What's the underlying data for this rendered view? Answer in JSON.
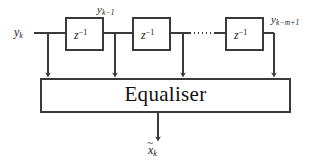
{
  "figure": {
    "kind": "block-diagram",
    "title_text": "Equaliser",
    "stroke_color": "#3a3a3a",
    "text_color": "#1a1a1a",
    "background_color": "#ffffff"
  },
  "signals": {
    "input": {
      "base": "y",
      "subscript": "k",
      "full": "y_k"
    },
    "tap1": {
      "base": "y",
      "subscript": "k−1",
      "full": "y_{k-1}"
    },
    "tap_last": {
      "base": "y",
      "subscript": "k−m+1",
      "full": "y_{k-m+1}"
    },
    "output": {
      "base": "x",
      "accent": "~",
      "subscript": "k",
      "full": "x̃_k"
    }
  },
  "delay_blocks": [
    {
      "id": "delay-1",
      "base": "z",
      "exponent": "−1",
      "full": "z^{-1}"
    },
    {
      "id": "delay-2",
      "base": "z",
      "exponent": "−1",
      "full": "z^{-1}"
    },
    {
      "id": "delay-3",
      "base": "z",
      "exponent": "−1",
      "full": "z^{-1}"
    }
  ],
  "equaliser": {
    "label": "Equaliser"
  },
  "ellipsis": {
    "style": "dotted-line",
    "meaning": "additional delay stages omitted"
  },
  "taps": {
    "count": 4,
    "note": "four downward arrows feed the equaliser"
  }
}
